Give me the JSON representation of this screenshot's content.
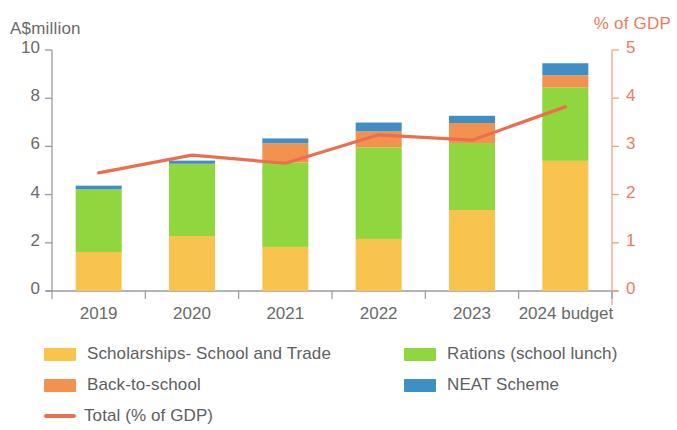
{
  "chart_data": {
    "type": "bar",
    "subtype": "stacked-bar-with-line",
    "title": "",
    "xlabel": "",
    "ylabel": "A$million",
    "y2label": "% of GDP",
    "ylim": [
      0,
      10
    ],
    "y2lim": [
      0,
      5
    ],
    "yticks": [
      "0",
      "2",
      "4",
      "6",
      "8",
      "10"
    ],
    "ytick_values": [
      0,
      2,
      4,
      6,
      8,
      10
    ],
    "y2ticks": [
      "0",
      "1",
      "2",
      "3",
      "4",
      "5"
    ],
    "y2tick_values": [
      0,
      1,
      2,
      3,
      4,
      5
    ],
    "grid": false,
    "legend_position": "below",
    "categories": [
      "2019",
      "2020",
      "2021",
      "2022",
      "2023",
      "2024 budget"
    ],
    "series": [
      {
        "name": "Scholarships- School and Trade",
        "color": "#f8c44e",
        "values": [
          1.62,
          2.28,
          1.83,
          2.16,
          3.36,
          5.4
        ]
      },
      {
        "name": "Rations (school lunch)",
        "color": "#90d63e",
        "values": [
          2.6,
          3.0,
          3.5,
          3.8,
          2.78,
          3.05
        ]
      },
      {
        "name": "Back-to-school",
        "color": "#f3924e",
        "values": [
          0.0,
          0.0,
          0.8,
          0.66,
          0.83,
          0.5
        ]
      },
      {
        "name": "NEAT Scheme",
        "color": "#3f8fc4",
        "values": [
          0.15,
          0.13,
          0.2,
          0.37,
          0.3,
          0.5
        ]
      }
    ],
    "line_series": {
      "name": "Total (% of GDP)",
      "color": "#ec6e50",
      "axis": "right",
      "values": [
        2.45,
        2.82,
        2.65,
        3.24,
        3.13,
        3.82
      ]
    }
  },
  "legend": {
    "items": [
      {
        "label": "Scholarships- School and Trade",
        "color": "#f8c44e",
        "marker": "swatch"
      },
      {
        "label": "Rations (school lunch)",
        "color": "#90d63e",
        "marker": "swatch"
      },
      {
        "label": "Back-to-school",
        "color": "#f3924e",
        "marker": "swatch"
      },
      {
        "label": "NEAT Scheme",
        "color": "#3f8fc4",
        "marker": "swatch"
      },
      {
        "label": "Total (% of GDP)",
        "color": "#ec6e50",
        "marker": "line"
      }
    ]
  },
  "axes": {
    "left_title": "A$million",
    "right_title": "% of GDP"
  }
}
